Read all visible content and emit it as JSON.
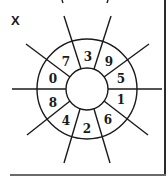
{
  "figure": {
    "label": "X",
    "center": [
      87,
      89
    ],
    "outer_radius": 50,
    "inner_radius": 21,
    "stroke_color": "#1a1a1a",
    "segments": [
      {
        "value": "3",
        "position": "top"
      },
      {
        "value": "9",
        "position": "top-right"
      },
      {
        "value": "5",
        "position": "right-upper"
      },
      {
        "value": "1",
        "position": "right-lower"
      },
      {
        "value": "6",
        "position": "bottom-right"
      },
      {
        "value": "2",
        "position": "bottom"
      },
      {
        "value": "4",
        "position": "bottom-left"
      },
      {
        "value": "8",
        "position": "left-lower"
      },
      {
        "value": "0",
        "position": "left-upper"
      },
      {
        "value": "7",
        "position": "top-left"
      }
    ]
  }
}
